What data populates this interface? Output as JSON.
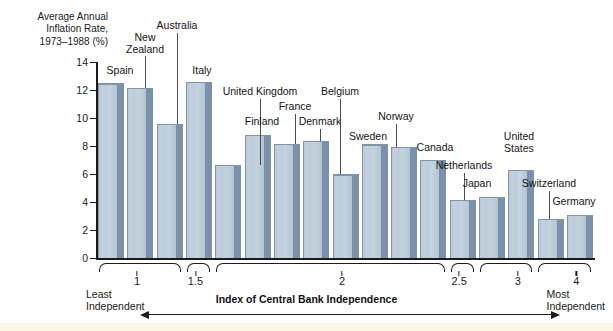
{
  "chart_data": {
    "type": "bar",
    "title": "",
    "ylabel": "Average Annual\nInflation Rate,\n1973–1988 (%)",
    "xlabel": "Index of Central Bank Independence",
    "ylim": [
      0,
      14
    ],
    "ytick_labels": [
      "0",
      "2",
      "4",
      "6",
      "8",
      "10",
      "12",
      "14"
    ],
    "ytick_values": [
      0,
      2,
      4,
      6,
      8,
      10,
      12,
      14
    ],
    "grid": false,
    "legend": "none",
    "categories": [
      "Spain",
      "New\nZealand",
      "Australia",
      "Italy",
      "United Kingdom",
      "Finland",
      "France",
      "Denmark",
      "Belgium",
      "Sweden",
      "Norway",
      "Canada",
      "Netherlands",
      "Japan",
      "United\nStates",
      "Switzerland",
      "Germany"
    ],
    "values": [
      12.4,
      12.1,
      9.5,
      12.5,
      6.6,
      8.7,
      8.1,
      8.3,
      5.9,
      8.05,
      7.85,
      6.95,
      4.1,
      4.3,
      6.2,
      2.7,
      3.0
    ],
    "bars": [
      {
        "label": "Spain",
        "value": 12.4,
        "label_x": 120,
        "label_y": 65,
        "lines": 1,
        "leader": false
      },
      {
        "label": "New\nZealand",
        "value": 12.1,
        "label_x": 145,
        "label_y": 32,
        "lines": 2,
        "leader": true,
        "leader_top": 56,
        "leader_bottom": 83
      },
      {
        "label": "Australia",
        "value": 9.5,
        "label_x": 177,
        "label_y": 20,
        "lines": 1,
        "leader": true,
        "leader_top": 33,
        "leader_bottom": 121
      },
      {
        "label": "Italy",
        "value": 12.5,
        "label_x": 202,
        "label_y": 65,
        "lines": 1,
        "leader": false
      },
      {
        "label": "United Kingdom",
        "value": 6.6,
        "label_x": 260,
        "label_y": 86,
        "lines": 1,
        "leader": true,
        "leader_top": 99,
        "leader_bottom": 166
      },
      {
        "label": "Finland",
        "value": 8.7,
        "label_x": 262,
        "label_y": 116,
        "lines": 1,
        "leader": false
      },
      {
        "label": "France",
        "value": 8.1,
        "label_x": 295,
        "label_y": 101,
        "lines": 1,
        "leader": true,
        "leader_top": 114,
        "leader_bottom": 144
      },
      {
        "label": "Denmark",
        "value": 8.3,
        "label_x": 320,
        "label_y": 116,
        "lines": 1,
        "leader": true,
        "leader_top": 129,
        "leader_bottom": 141
      },
      {
        "label": "Belgium",
        "value": 5.9,
        "label_x": 340,
        "label_y": 86,
        "lines": 1,
        "leader": true,
        "leader_top": 99,
        "leader_bottom": 176
      },
      {
        "label": "Sweden",
        "value": 8.05,
        "label_x": 368,
        "label_y": 131,
        "lines": 1,
        "leader": false
      },
      {
        "label": "Norway",
        "value": 7.85,
        "label_x": 396,
        "label_y": 111,
        "lines": 1,
        "leader": true,
        "leader_top": 124,
        "leader_bottom": 148
      },
      {
        "label": "Canada",
        "value": 6.95,
        "label_x": 435,
        "label_y": 142,
        "lines": 1,
        "leader": false
      },
      {
        "label": "Netherlands",
        "value": 4.1,
        "label_x": 464,
        "label_y": 160,
        "lines": 1,
        "leader": true,
        "leader_top": 173,
        "leader_bottom": 201
      },
      {
        "label": "Japan",
        "value": 4.3,
        "label_x": 477,
        "label_y": 178,
        "lines": 1,
        "leader": false
      },
      {
        "label": "United\nStates",
        "value": 6.2,
        "label_x": 519,
        "label_y": 131,
        "lines": 2,
        "leader": false
      },
      {
        "label": "Switzerland",
        "value": 2.7,
        "label_x": 549,
        "label_y": 178,
        "lines": 1,
        "leader": true,
        "leader_top": 191,
        "leader_bottom": 221
      },
      {
        "label": "Germany",
        "value": 3.0,
        "label_x": 574,
        "label_y": 196,
        "lines": 1,
        "leader": false
      }
    ],
    "groups": [
      {
        "label": "1",
        "start_bar": 0,
        "end_bar": 2,
        "label_bar": 1
      },
      {
        "label": "1.5",
        "start_bar": 3,
        "end_bar": 3,
        "label_bar": 3
      },
      {
        "label": "2",
        "start_bar": 4,
        "end_bar": 11,
        "label_bar": 8
      },
      {
        "label": "2.5",
        "start_bar": 12,
        "end_bar": 12,
        "label_bar": 12
      },
      {
        "label": "3",
        "start_bar": 13,
        "end_bar": 14,
        "label_bar": 14
      },
      {
        "label": "4",
        "start_bar": 15,
        "end_bar": 16,
        "label_bar": 16
      }
    ],
    "axis_endpoints": {
      "left_label": "Least\nIndependent",
      "right_label": "Most\nIndependent"
    },
    "colors": {
      "bar_face": "#c3d1df",
      "bar_side": "#7b90a9",
      "bar_outline": "#8496ab",
      "axis": "#1b1b1b",
      "text": "#1b1b1b",
      "background": "#ffffff",
      "bottom_band": "#fcf7e4"
    }
  }
}
